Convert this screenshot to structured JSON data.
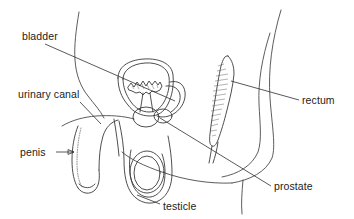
{
  "figure": {
    "background_color": "#ffffff",
    "line_color": "#3a3a3a",
    "text_color": "#222222"
  },
  "labels": [
    {
      "id": "bladder",
      "text": "bladder",
      "x": 22,
      "y": 40,
      "anchor": "start",
      "leader": {
        "type": "line",
        "x1": 45,
        "y1": 44,
        "x2": 175,
        "y2": 101
      }
    },
    {
      "id": "urinary-canal",
      "text": "urinary canal",
      "x": 18,
      "y": 98,
      "anchor": "start",
      "leader": {
        "type": "line",
        "x1": 80,
        "y1": 102,
        "x2": 101,
        "y2": 124
      }
    },
    {
      "id": "penis",
      "text": "penis",
      "x": 20,
      "y": 156,
      "anchor": "start",
      "leader": {
        "type": "arrow",
        "x1": 56,
        "y1": 152,
        "x2": 74,
        "y2": 152
      }
    },
    {
      "id": "testicle",
      "text": "testicle",
      "x": 163,
      "y": 210,
      "anchor": "start",
      "leader": {
        "type": "line",
        "x1": 137,
        "y1": 195,
        "x2": 160,
        "y2": 204
      }
    },
    {
      "id": "rectum",
      "text": "rectum",
      "x": 302,
      "y": 104,
      "anchor": "start",
      "leader": {
        "type": "line",
        "x1": 231,
        "y1": 81,
        "x2": 299,
        "y2": 100
      }
    },
    {
      "id": "prostate",
      "text": "prostate",
      "x": 274,
      "y": 190,
      "anchor": "start",
      "leader": {
        "type": "line",
        "x1": 160,
        "y1": 118,
        "x2": 271,
        "y2": 186
      }
    }
  ],
  "organs": {
    "bladder": {
      "name": "bladder",
      "description": "rounded double-walled sac with jagged inner lining"
    },
    "rectum": {
      "name": "rectum",
      "description": "elongated vertical stippled organ"
    },
    "prostate": {
      "name": "prostate",
      "description": "small rounded gland below bladder"
    },
    "testicle": {
      "name": "testicle",
      "description": "oval inside scrotum"
    },
    "penis": {
      "name": "penis",
      "description": "shaft with dotted urinary canal"
    },
    "urinary_canal": {
      "name": "urinary canal",
      "description": "dotted channel through penis"
    }
  }
}
